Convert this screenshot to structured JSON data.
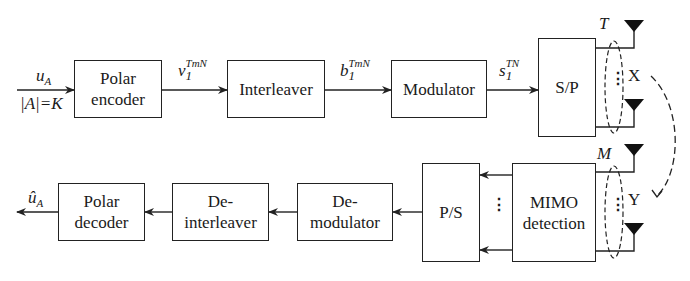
{
  "diagram": {
    "type": "block-diagram",
    "transmitter": {
      "input": {
        "symbol": "u",
        "subscript": "A",
        "constraint": "|A|=K"
      },
      "blocks": [
        {
          "id": "polar_encoder",
          "line1": "Polar",
          "line2": "encoder"
        },
        {
          "id": "interleaver",
          "line1": "Interleaver"
        },
        {
          "id": "modulator",
          "line1": "Modulator"
        },
        {
          "id": "sp",
          "line1": "S/P"
        }
      ],
      "signals": [
        {
          "base": "v",
          "sub": "1",
          "sup": "TmN"
        },
        {
          "base": "b",
          "sub": "1",
          "sup": "TmN"
        },
        {
          "base": "s",
          "sub": "1",
          "sup": "TN"
        }
      ],
      "antenna_count_label": "T",
      "channel_input_label": "X"
    },
    "receiver": {
      "antenna_count_label": "M",
      "channel_output_label": "Y",
      "blocks": [
        {
          "id": "mimo_detection",
          "line1": "MIMO",
          "line2": "detection"
        },
        {
          "id": "ps",
          "line1": "P/S"
        },
        {
          "id": "demodulator",
          "line1": "De-",
          "line2": "modulator"
        },
        {
          "id": "deinterleaver",
          "line1": "De-",
          "line2": "interleaver"
        },
        {
          "id": "polar_decoder",
          "line1": "Polar",
          "line2": "decoder"
        }
      ],
      "output": {
        "symbol": "û",
        "subscript": "A"
      }
    },
    "ellipsis": "⋮"
  }
}
